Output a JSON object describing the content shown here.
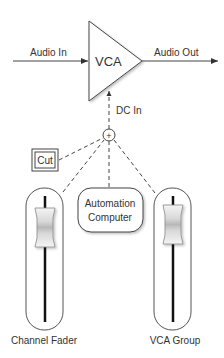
{
  "diagram": {
    "vca": {
      "label": "VCA"
    },
    "audio_in": {
      "label": "Audio In"
    },
    "audio_out": {
      "label": "Audio Out"
    },
    "dc_in": {
      "label": "DC In"
    },
    "summing_node": {
      "symbol": "+"
    },
    "cut_button": {
      "label": "Cut"
    },
    "automation": {
      "line1": "Automation",
      "line2": "Computer"
    },
    "channel_fader": {
      "label": "Channel Fader"
    },
    "vca_group": {
      "label": "VCA Group"
    }
  },
  "colors": {
    "stroke": "#444444",
    "text": "#333333",
    "background": "#ffffff"
  }
}
